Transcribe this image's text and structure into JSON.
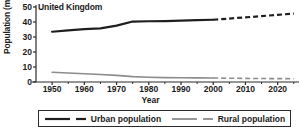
{
  "chart_data": {
    "type": "line",
    "title": "United Kingdom",
    "xlabel": "Year",
    "ylabel": "Population (millions)",
    "xlim": [
      1945,
      2026
    ],
    "ylim": [
      0,
      50
    ],
    "xticks": [
      1950,
      1960,
      1970,
      1980,
      1990,
      2000,
      2010,
      2020
    ],
    "yticks": [
      0,
      10,
      20,
      30,
      40,
      50
    ],
    "grid": false,
    "legend_position": "bottom",
    "series": [
      {
        "name": "Urban population",
        "color": "#1f1f1f",
        "width": 2.2,
        "observed": {
          "x": [
            1950,
            1955,
            1960,
            1965,
            1970,
            1975,
            1980,
            1985,
            1990,
            1995,
            2000
          ],
          "y": [
            33.5,
            34.4,
            35.2,
            35.8,
            37.6,
            40.3,
            40.5,
            40.6,
            40.9,
            41.2,
            41.5
          ]
        },
        "projected": {
          "x": [
            2000,
            2005,
            2010,
            2015,
            2020,
            2025
          ],
          "y": [
            41.5,
            42.3,
            43.1,
            43.9,
            44.8,
            45.6
          ]
        }
      },
      {
        "name": "Rural population",
        "color": "#8c8c8c",
        "width": 1.6,
        "observed": {
          "x": [
            1950,
            1955,
            1960,
            1965,
            1970,
            1975,
            1980,
            1985,
            1990,
            1995,
            2000
          ],
          "y": [
            6.5,
            6.0,
            5.5,
            5.0,
            4.4,
            3.6,
            3.2,
            2.9,
            2.8,
            2.75,
            2.7
          ]
        },
        "projected": {
          "x": [
            2000,
            2005,
            2010,
            2015,
            2020,
            2025
          ],
          "y": [
            2.7,
            2.5,
            2.4,
            2.3,
            2.25,
            2.2
          ]
        }
      }
    ]
  },
  "legend": {
    "items": [
      {
        "label": "Urban population"
      },
      {
        "label": "Rural population"
      }
    ]
  }
}
